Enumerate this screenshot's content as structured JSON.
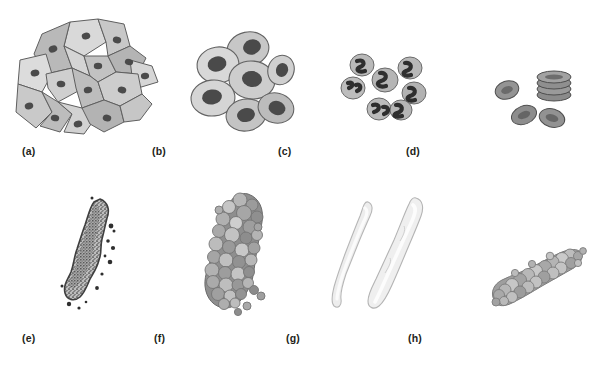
{
  "figure": {
    "background_color": "#ffffff",
    "width": 612,
    "height": 371,
    "layout": "4 columns x 2 rows of labeled illustration panels",
    "panel_count": 8
  },
  "palette": {
    "cell_fill_light": "#dcdcdc",
    "cell_fill_mid": "#b8b8b8",
    "cell_fill_dark": "#a0a0a0",
    "nucleus_dark": "#4d4d4d",
    "nucleus_darker": "#3a3a3a",
    "outline": "#5a5a5a",
    "outline_soft": "#8d8d8d",
    "hyaline_fill": "#ededed",
    "hyaline_highlight": "#fafafa",
    "granule_light": "#cfcfcf",
    "granule_mid": "#9e9e9e",
    "granule_dark": "#6e6e6e",
    "speckle": "#3f3f3f",
    "caption_color": "#231f20"
  },
  "panels": [
    {
      "id": "a",
      "label": "(a)",
      "subject": "squamous epithelial cells",
      "description": "overlapping sheet of large flat polygonal cells, each with one small dark round nucleus",
      "cell_count": 14,
      "nucleus_count": 14,
      "shape": "angular polygonal",
      "label_x": 22,
      "label_y": 145,
      "art_x": 12,
      "art_y": 16,
      "art_w": 150,
      "art_h": 122
    },
    {
      "id": "b",
      "label": "(b)",
      "subject": "transitional epithelial cells",
      "description": "cluster of rounded cells with large dark oval nuclei",
      "cell_count": 7,
      "nucleus_count": 7,
      "shape": "round to oval",
      "label_x": 152,
      "label_y": 145,
      "art_x": 186,
      "art_y": 30,
      "art_w": 112,
      "art_h": 108
    },
    {
      "id": "c",
      "label": "(c)",
      "subject": "white blood cells (neutrophils)",
      "description": "scattered round leukocytes with dark multilobed S-shaped nuclei",
      "cell_count": 7,
      "nucleus_count": 7,
      "shape": "round, granular cytoplasm",
      "label_x": 278,
      "label_y": 145,
      "art_x": 340,
      "art_y": 52,
      "art_w": 94,
      "art_h": 76
    },
    {
      "id": "d",
      "label": "(d)",
      "subject": "red blood cells",
      "description": "three separate biconcave discs plus a stacked rouleaux column of four cells",
      "cell_count": 7,
      "stack_count": 4,
      "loose_count": 3,
      "shape": "biconcave disc",
      "label_x": 406,
      "label_y": 145,
      "art_x": 492,
      "art_y": 62,
      "art_w": 88,
      "art_h": 70
    },
    {
      "id": "e",
      "label": "(e)",
      "subject": "fine granular cast",
      "description": "elongated cylinder filled with dense fine dark stippling, irregular edges",
      "orientation": "diagonal, upper-right to lower-left",
      "texture": "fine speckled granules",
      "label_x": 22,
      "label_y": 332,
      "art_x": 56,
      "art_y": 196,
      "art_w": 80,
      "art_h": 118
    },
    {
      "id": "f",
      "label": "(f)",
      "subject": "coarse granular cast",
      "description": "thick elongated cast composed of many large pebble-like granules in light and dark grey",
      "orientation": "diagonal, upper-right to lower-left",
      "texture": "coarse pebbled granules",
      "label_x": 154,
      "label_y": 332,
      "art_x": 192,
      "art_y": 190,
      "art_w": 96,
      "art_h": 126
    },
    {
      "id": "g",
      "label": "(g)",
      "subject": "hyaline casts",
      "description": "two pale, nearly colorless smooth cylinders with rounded ends and faint outlines",
      "cast_count": 2,
      "texture": "smooth translucent",
      "label_x": 286,
      "label_y": 332,
      "art_x": 332,
      "art_y": 196,
      "art_w": 100,
      "art_h": 122
    },
    {
      "id": "h",
      "label": "(h)",
      "subject": "cellular cast",
      "description": "short cast packed with rounded cells/lobules, oriented diagonally lower-left to upper-right",
      "orientation": "diagonal, lower-left to upper-right",
      "texture": "rounded cellular lobules",
      "label_x": 408,
      "label_y": 332,
      "art_x": 484,
      "art_y": 242,
      "art_w": 104,
      "art_h": 76
    }
  ]
}
